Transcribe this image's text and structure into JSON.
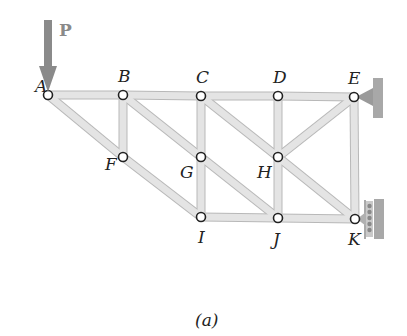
{
  "figure": {
    "caption": "(a)",
    "load": {
      "label": "P",
      "node": "A",
      "color": "#8a8a8a"
    },
    "nodes": [
      {
        "id": "A",
        "x": 48,
        "y": 95,
        "lx": 35,
        "ly": 92
      },
      {
        "id": "B",
        "x": 123,
        "y": 95,
        "lx": 118,
        "ly": 82
      },
      {
        "id": "C",
        "x": 201,
        "y": 96,
        "lx": 196,
        "ly": 83
      },
      {
        "id": "D",
        "x": 278,
        "y": 96,
        "lx": 273,
        "ly": 83
      },
      {
        "id": "E",
        "x": 354,
        "y": 97,
        "lx": 348,
        "ly": 84
      },
      {
        "id": "F",
        "x": 123,
        "y": 157,
        "lx": 105,
        "ly": 170
      },
      {
        "id": "G",
        "x": 201,
        "y": 157,
        "lx": 180,
        "ly": 178
      },
      {
        "id": "H",
        "x": 278,
        "y": 157,
        "lx": 257,
        "ly": 178
      },
      {
        "id": "I",
        "x": 201,
        "y": 217,
        "lx": 198,
        "ly": 243
      },
      {
        "id": "J",
        "x": 278,
        "y": 218,
        "lx": 273,
        "ly": 245
      },
      {
        "id": "K",
        "x": 355,
        "y": 219,
        "lx": 348,
        "ly": 245
      }
    ],
    "members": [
      [
        "A",
        "B"
      ],
      [
        "B",
        "C"
      ],
      [
        "C",
        "D"
      ],
      [
        "D",
        "E"
      ],
      [
        "A",
        "F"
      ],
      [
        "F",
        "I"
      ],
      [
        "I",
        "J"
      ],
      [
        "J",
        "K"
      ],
      [
        "B",
        "F"
      ],
      [
        "C",
        "G"
      ],
      [
        "G",
        "I"
      ],
      [
        "D",
        "H"
      ],
      [
        "H",
        "J"
      ],
      [
        "E",
        "K"
      ],
      [
        "B",
        "G"
      ],
      [
        "G",
        "J"
      ],
      [
        "C",
        "H"
      ],
      [
        "H",
        "K"
      ],
      [
        "H",
        "E"
      ]
    ],
    "supports": [
      {
        "type": "pin",
        "node": "E"
      },
      {
        "type": "roller",
        "node": "K"
      }
    ],
    "colors": {
      "member_fill": "#e4e4e4",
      "member_edge": "#b8b8b8",
      "node_fill": "#ffffff",
      "node_edge": "#222222",
      "wall": "#a8a8a8",
      "label": "#222222"
    }
  }
}
